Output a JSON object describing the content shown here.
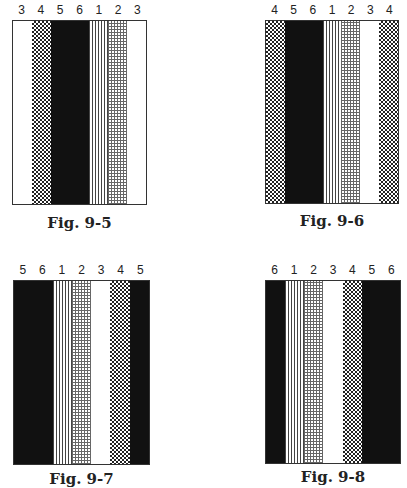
{
  "pattern_legend": {
    "1": "vertical-lines",
    "2": "fine-grid",
    "3": "white",
    "4": "checker",
    "5": "black",
    "6": "black"
  },
  "figures": [
    {
      "caption": "Fig. 9-5",
      "bands": [
        {
          "label": "3",
          "pattern": "white"
        },
        {
          "label": "4",
          "pattern": "checker"
        },
        {
          "label": "5",
          "pattern": "black"
        },
        {
          "label": "6",
          "pattern": "black"
        },
        {
          "label": "1",
          "pattern": "lines"
        },
        {
          "label": "2",
          "pattern": "grid"
        },
        {
          "label": "3",
          "pattern": "white"
        }
      ]
    },
    {
      "caption": "Fig. 9-6",
      "bands": [
        {
          "label": "4",
          "pattern": "checker"
        },
        {
          "label": "5",
          "pattern": "black"
        },
        {
          "label": "6",
          "pattern": "black"
        },
        {
          "label": "1",
          "pattern": "lines"
        },
        {
          "label": "2",
          "pattern": "grid"
        },
        {
          "label": "3",
          "pattern": "white"
        },
        {
          "label": "4",
          "pattern": "checker"
        }
      ]
    },
    {
      "caption": "Fig. 9-7",
      "bands": [
        {
          "label": "5",
          "pattern": "black"
        },
        {
          "label": "6",
          "pattern": "black"
        },
        {
          "label": "1",
          "pattern": "lines"
        },
        {
          "label": "2",
          "pattern": "grid"
        },
        {
          "label": "3",
          "pattern": "white"
        },
        {
          "label": "4",
          "pattern": "checker"
        },
        {
          "label": "5",
          "pattern": "black"
        }
      ]
    },
    {
      "caption": "Fig. 9-8",
      "bands": [
        {
          "label": "6",
          "pattern": "black"
        },
        {
          "label": "1",
          "pattern": "lines"
        },
        {
          "label": "2",
          "pattern": "grid"
        },
        {
          "label": "3",
          "pattern": "white"
        },
        {
          "label": "4",
          "pattern": "checker"
        },
        {
          "label": "5",
          "pattern": "black"
        },
        {
          "label": "6",
          "pattern": "black"
        }
      ]
    }
  ]
}
